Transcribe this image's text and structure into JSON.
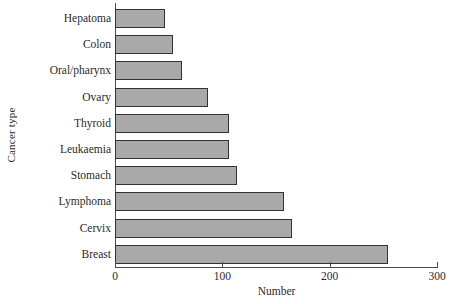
{
  "chart_data": {
    "type": "bar",
    "orientation": "horizontal",
    "title": "",
    "xlabel": "Number",
    "ylabel": "Cancer type",
    "categories": [
      "Hepatoma",
      "Colon",
      "Oral/pharynx",
      "Ovary",
      "Thyroid",
      "Leukaemia",
      "Stomach",
      "Lymphoma",
      "Cervix",
      "Breast"
    ],
    "values": [
      47,
      54,
      62,
      87,
      106,
      106,
      114,
      157,
      165,
      254
    ],
    "xlim": [
      0,
      300
    ],
    "xticks": [
      0,
      100,
      200,
      300
    ],
    "xtick_labels": [
      "0",
      "100",
      "200",
      "300"
    ],
    "grid": false,
    "legend": false,
    "bar_fill_color": "#a9a9a9",
    "bar_edge_color": "#333333",
    "axis_color": "#4d4d4d",
    "background_color": "#ffffff"
  }
}
